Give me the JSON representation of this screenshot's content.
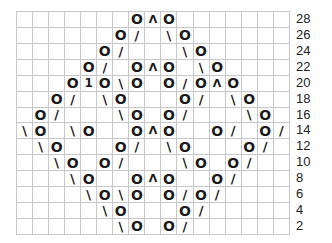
{
  "chart": {
    "columns": 17,
    "rows": 14,
    "legend_symbols": {
      "O": "yarn over",
      "/": "k2tog",
      "\\": "ssk",
      "^": "double decrease",
      "1": "double decrease (variant)"
    },
    "row_labels": [
      "28",
      "26",
      "24",
      "22",
      "20",
      "18",
      "16",
      "14",
      "12",
      "10",
      "8",
      "6",
      "4",
      "2"
    ],
    "grid": [
      {
        "row": "28",
        "cells": {
          "7": "O",
          "8": "^",
          "9": "O"
        }
      },
      {
        "row": "26",
        "cells": {
          "6": "O",
          "7": "/",
          "9": "\\",
          "10": "O"
        }
      },
      {
        "row": "24",
        "cells": {
          "5": "O",
          "6": "/",
          "10": "\\",
          "11": "O"
        }
      },
      {
        "row": "22",
        "cells": {
          "4": "O",
          "5": "/",
          "7": "O",
          "8": "^",
          "9": "O",
          "11": "\\",
          "12": "O"
        }
      },
      {
        "row": "20",
        "cells": {
          "3": "O",
          "4": "1",
          "5": "O",
          "6": "\\",
          "7": "O",
          "9": "O",
          "10": "/",
          "11": "O",
          "12": "^",
          "13": "O"
        }
      },
      {
        "row": "18",
        "cells": {
          "2": "O",
          "3": "/",
          "5": "\\",
          "6": "O",
          "10": "O",
          "11": "/",
          "13": "\\",
          "14": "O"
        }
      },
      {
        "row": "16",
        "cells": {
          "1": "O",
          "2": "/",
          "6": "\\",
          "7": "O",
          "9": "O",
          "10": "/",
          "14": "\\",
          "15": "O"
        }
      },
      {
        "row": "14",
        "cells": {
          "0": "\\",
          "1": "O",
          "3": "\\",
          "4": "O",
          "7": "O",
          "8": "^",
          "9": "O",
          "12": "O",
          "13": "/",
          "15": "O",
          "16": "/"
        }
      },
      {
        "row": "12",
        "cells": {
          "1": "\\",
          "2": "O",
          "6": "O",
          "7": "/",
          "9": "\\",
          "10": "O",
          "14": "O",
          "15": "/"
        }
      },
      {
        "row": "10",
        "cells": {
          "2": "\\",
          "3": "O",
          "5": "O",
          "6": "/",
          "10": "\\",
          "11": "O",
          "13": "O",
          "14": "/"
        }
      },
      {
        "row": "8",
        "cells": {
          "3": "\\",
          "4": "O",
          "7": "O",
          "8": "^",
          "9": "O",
          "12": "O",
          "13": "/"
        }
      },
      {
        "row": "6",
        "cells": {
          "4": "\\",
          "5": "O",
          "6": "\\",
          "7": "O",
          "9": "O",
          "10": "/",
          "11": "O",
          "12": "/"
        }
      },
      {
        "row": "4",
        "cells": {
          "5": "\\",
          "6": "O",
          "10": "O",
          "11": "/"
        }
      },
      {
        "row": "2",
        "cells": {
          "6": "\\",
          "7": "O",
          "9": "O",
          "10": "/"
        }
      }
    ]
  },
  "colors": {
    "grid_line": "#c8c8c8",
    "symbol": "#1a1a1a",
    "background": "#ffffff"
  }
}
